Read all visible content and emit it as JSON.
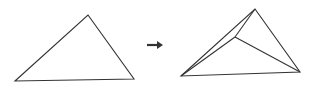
{
  "diagram": {
    "stroke_color": "#333333",
    "arrow_color": "#333333",
    "before": {
      "triangle": [
        [
          15,
          81
        ],
        [
          88,
          15
        ],
        [
          134,
          79
        ]
      ]
    },
    "arrow": {
      "from": [
        147,
        45
      ],
      "to": [
        163,
        45
      ],
      "glyph": "right-arrow"
    },
    "after": {
      "outer": [
        [
          181,
          76
        ],
        [
          255,
          9
        ],
        [
          300,
          72
        ]
      ],
      "inner_point": [
        235,
        37
      ],
      "inner_edges": [
        [
          [
            181,
            76
          ],
          [
            235,
            37
          ]
        ],
        [
          [
            255,
            9
          ],
          [
            235,
            37
          ]
        ],
        [
          [
            300,
            72
          ],
          [
            235,
            37
          ]
        ]
      ]
    }
  }
}
